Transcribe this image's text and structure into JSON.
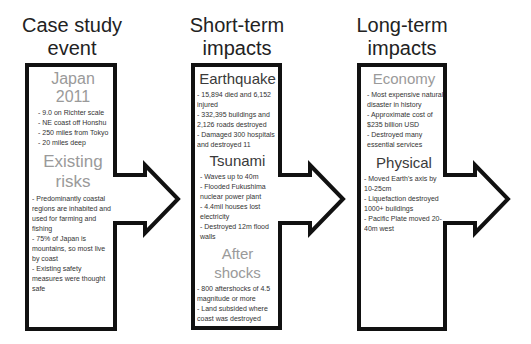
{
  "columns": [
    {
      "heading_line1": "Case study",
      "heading_line2": "event",
      "sections": [
        {
          "title": "Japan 2011",
          "title_color": "#9a9a9a",
          "items": [
            "- 9.0 on Richter scale",
            "- NE coast off Honshu",
            "- 250 miles from Tokyo",
            "- 20 miles deep"
          ]
        },
        {
          "title_line1": "Existing",
          "title_line2": "risks",
          "title_color": "#9a9a9a",
          "items": [
            "- Predominantly coastal regions are inhabited and used for farming and fishing",
            "- 75% of Japan is mountains, so most live by coast",
            "- Existing safety measures were thought safe"
          ]
        }
      ]
    },
    {
      "heading_line1": "Short-term",
      "heading_line2": "impacts",
      "sections": [
        {
          "title": "Earthquake",
          "title_color": "#3a3a3a",
          "items": [
            "- 15,894 died and 6,152 injured",
            "- 332,395 buildings and 2,126 roads destroyed",
            "- Damaged 300 hospitals and destroyed 11"
          ]
        },
        {
          "title": "Tsunami",
          "title_color": "#3a3a3a",
          "items": [
            "- Waves up to 40m",
            "- Flooded Fukushima nuclear power plant",
            "- 4.4mil houses lost electricity",
            "- Destroyed 12m flood walls"
          ]
        },
        {
          "title_line1": "After",
          "title_line2": "shocks",
          "title_color": "#9a9a9a",
          "items": [
            "- 800 aftershocks of 4.5 magnitude or more",
            "- Land subsided where coast was destroyed"
          ]
        }
      ]
    },
    {
      "heading_line1": "Long-term",
      "heading_line2": "impacts",
      "sections": [
        {
          "title": "Economy",
          "title_color": "#9a9a9a",
          "items": [
            "- Most expensive natural disaster in history",
            "- Approximate cost of $235 billion USD",
            "- Destroyed many essential services"
          ]
        },
        {
          "title": "Physical",
          "title_color": "#3a3a3a",
          "items": [
            "- Moved Earth's axis by 10-25cm",
            "- Liquefaction destroyed 1000+ buildings",
            "- Pacific Plate moved 20-40m west"
          ]
        }
      ]
    }
  ],
  "colors": {
    "outline": "#111111",
    "background": "#ffffff"
  }
}
